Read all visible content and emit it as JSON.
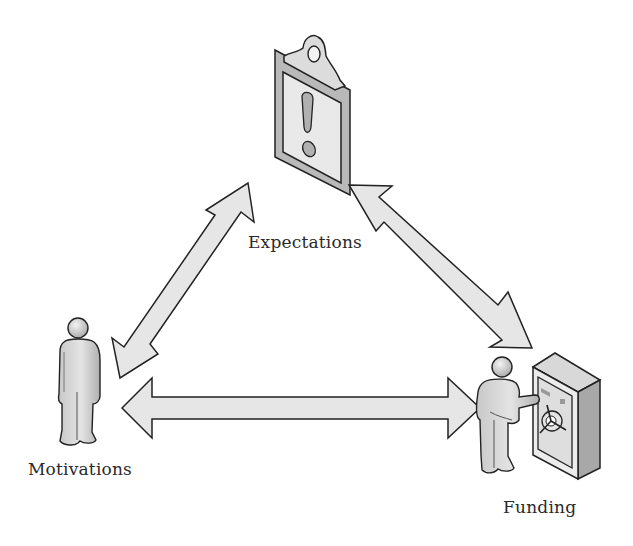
{
  "diagram": {
    "type": "triangle-relationship",
    "nodes": [
      {
        "id": "expectations",
        "label": "Expectations",
        "icon": "clipboard-exclamation-icon"
      },
      {
        "id": "motivations",
        "label": "Motivations",
        "icon": "person-icon"
      },
      {
        "id": "funding",
        "label": "Funding",
        "icon": "person-opening-safe-icon"
      }
    ],
    "edges": [
      {
        "from": "motivations",
        "to": "expectations",
        "style": "double-arrow"
      },
      {
        "from": "expectations",
        "to": "funding",
        "style": "double-arrow"
      },
      {
        "from": "motivations",
        "to": "funding",
        "style": "double-arrow"
      }
    ],
    "colors": {
      "fill_light": "#e6e6e6",
      "fill_mid": "#bdbdbd",
      "fill_dark": "#9a9a9a",
      "stroke": "#222222",
      "text": "#2a2a2a"
    }
  }
}
